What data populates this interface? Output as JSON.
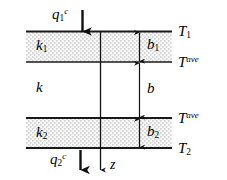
{
  "figure": {
    "background_color": "#ffffff",
    "line_color": "#1a1a1a",
    "stipple_color": "#9a9a9a",
    "width": 227,
    "height": 180
  },
  "layers": [
    {
      "name": "top-layer",
      "conductivity_label": "k",
      "conductivity_sub": "1",
      "thickness_label": "b",
      "thickness_sub": "1",
      "hatched": true
    },
    {
      "name": "middle-layer",
      "conductivity_label": "k",
      "conductivity_sub": "",
      "thickness_label": "b",
      "thickness_sub": "",
      "hatched": false
    },
    {
      "name": "bottom-layer",
      "conductivity_label": "k",
      "conductivity_sub": "2",
      "thickness_label": "b",
      "thickness_sub": "2",
      "hatched": true
    }
  ],
  "boundaries": [
    {
      "name": "top-surface",
      "label": "T",
      "sub": "1",
      "sup": ""
    },
    {
      "name": "upper-interface",
      "label": "T",
      "sub": "",
      "sup": "ave"
    },
    {
      "name": "lower-interface",
      "label": "T",
      "sub": "",
      "sup": "ave"
    },
    {
      "name": "bottom-surface",
      "label": "T",
      "sub": "2",
      "sup": ""
    }
  ],
  "fluxes": [
    {
      "name": "inlet-flux",
      "label": "q",
      "sub": "1",
      "sup": "c",
      "direction": "down"
    },
    {
      "name": "outlet-flux",
      "label": "q",
      "sub": "2",
      "sup": "c",
      "direction": "down"
    }
  ],
  "axis": {
    "name": "z-axis",
    "label": "z",
    "direction": "down"
  }
}
